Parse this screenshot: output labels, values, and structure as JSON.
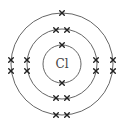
{
  "diagram": {
    "type": "bohr-model",
    "element_symbol": "Cl",
    "center": [
      62,
      64
    ],
    "shells": [
      {
        "name": "shell-1",
        "radius": 19,
        "electron_count": 2,
        "electrons": [
          [
            62,
            45
          ],
          [
            62,
            83
          ]
        ]
      },
      {
        "name": "shell-2",
        "radius": 35,
        "electron_count": 8,
        "electrons": [
          [
            56,
            30
          ],
          [
            67,
            30
          ],
          [
            56,
            98
          ],
          [
            67,
            98
          ],
          [
            27,
            60
          ],
          [
            27,
            71
          ],
          [
            96,
            60
          ],
          [
            96,
            71
          ]
        ]
      },
      {
        "name": "shell-3",
        "radius": 51,
        "electron_count": 7,
        "electrons": [
          [
            62,
            13
          ],
          [
            56,
            115
          ],
          [
            67,
            115
          ],
          [
            11,
            60
          ],
          [
            11,
            71
          ],
          [
            113,
            60
          ],
          [
            113,
            71
          ]
        ]
      }
    ],
    "colors": {
      "line": "#555555",
      "electron": "#222222",
      "label": "#444444"
    }
  }
}
